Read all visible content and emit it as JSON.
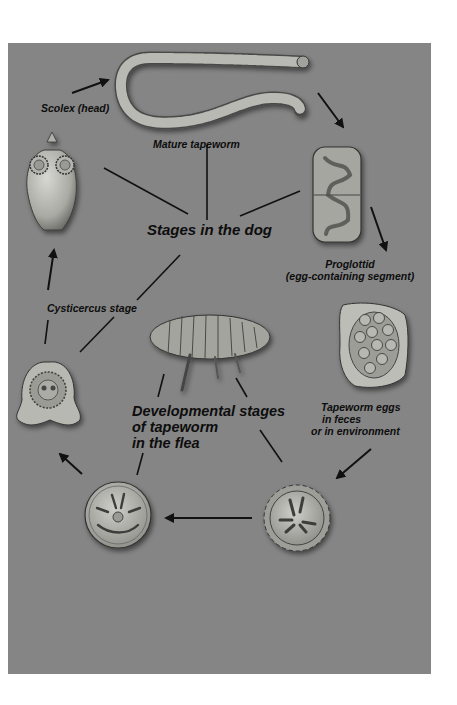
{
  "figure": {
    "colors": {
      "panel_bg": "#858585",
      "page_bg": "#ffffff",
      "text": "#0d0d0d",
      "line": "#111111",
      "specimen_light": "#c9c9c4",
      "specimen_mid": "#a8a8a2",
      "specimen_dark": "#5a5a58"
    }
  },
  "labels": {
    "scolex": "Scolex (head)",
    "mature_tapeworm": "Mature tapeworm",
    "stages_in_dog": "Stages in the dog",
    "proglottid_line1": "Proglottid",
    "proglottid_line2": "(egg-containing segment)",
    "cysticercus": "Cysticercus stage",
    "flea_line1": "Developmental stages",
    "flea_line2": "of tapeworm",
    "flea_line3": "in the flea",
    "eggs_line1": "Tapeworm eggs",
    "eggs_line2": "in feces",
    "eggs_line3": "or in environment"
  },
  "specimens": [
    {
      "id": "scolex-head",
      "name": "Scolex (head)"
    },
    {
      "id": "mature-tapeworm",
      "name": "Mature tapeworm"
    },
    {
      "id": "proglottid",
      "name": "Proglottid"
    },
    {
      "id": "egg-packet",
      "name": "Tapeworm eggs"
    },
    {
      "id": "oncosphere",
      "name": "Spiked larval stage"
    },
    {
      "id": "flea-larval-stage",
      "name": "Larval stage in flea"
    },
    {
      "id": "cysticercus",
      "name": "Cysticercus stage"
    },
    {
      "id": "flea",
      "name": "Flea"
    }
  ],
  "cycle_arrows": [
    {
      "from": "Scolex (head)",
      "to": "Mature tapeworm"
    },
    {
      "from": "Mature tapeworm",
      "to": "Proglottid"
    },
    {
      "from": "Proglottid",
      "to": "Tapeworm eggs"
    },
    {
      "from": "Tapeworm eggs",
      "to": "Spiked larval stage"
    },
    {
      "from": "Spiked larval stage",
      "to": "Larval stage in flea"
    },
    {
      "from": "Larval stage in flea",
      "to": "Cysticercus stage"
    },
    {
      "from": "Cysticercus stage",
      "to": "Scolex (head)"
    }
  ]
}
